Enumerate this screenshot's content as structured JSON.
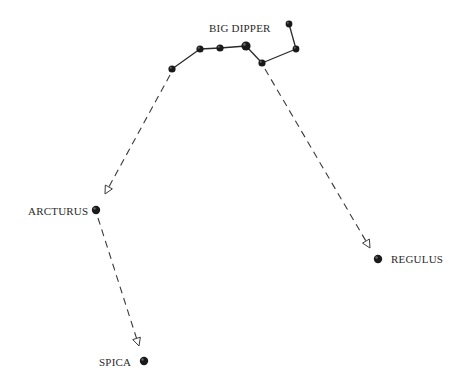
{
  "diagram": {
    "colors": {
      "background": "#ffffff",
      "ink": "#2a2a2a",
      "star_fill": "#1a1a1a"
    },
    "constellation": {
      "label": "BIG DIPPER",
      "label_pos": [
        209,
        32
      ],
      "stars": [
        {
          "id": "handle-end",
          "x": 172,
          "y": 69,
          "r": 3.6
        },
        {
          "id": "handle-2",
          "x": 200,
          "y": 49,
          "r": 3.6
        },
        {
          "id": "handle-3",
          "x": 220,
          "y": 48,
          "r": 3.6
        },
        {
          "id": "bowl-1",
          "x": 246,
          "y": 46,
          "r": 4.6
        },
        {
          "id": "bowl-2",
          "x": 262,
          "y": 63,
          "r": 3.6
        },
        {
          "id": "bowl-3",
          "x": 296,
          "y": 49,
          "r": 3.4
        },
        {
          "id": "bowl-4",
          "x": 289,
          "y": 24,
          "r": 3.4
        }
      ],
      "edges": [
        [
          0,
          1
        ],
        [
          1,
          2
        ],
        [
          2,
          3
        ],
        [
          3,
          4
        ],
        [
          4,
          5
        ],
        [
          5,
          6
        ]
      ]
    },
    "targets": [
      {
        "name": "ARCTURUS",
        "x": 96,
        "y": 210,
        "r": 4.2,
        "label_pos": [
          28,
          215
        ],
        "label_anchor": "start"
      },
      {
        "name": "SPICA",
        "x": 144,
        "y": 361,
        "r": 4.2,
        "label_pos": [
          99,
          366
        ],
        "label_anchor": "start"
      },
      {
        "name": "REGULUS",
        "x": 378,
        "y": 259,
        "r": 4.2,
        "label_pos": [
          391,
          263
        ],
        "label_anchor": "start"
      }
    ],
    "pointers": [
      {
        "name": "arc-to-arcturus",
        "from": [
          170,
          75
        ],
        "to": [
          105,
          194
        ]
      },
      {
        "name": "arcturus-to-spica",
        "from": [
          98,
          218
        ],
        "to": [
          139,
          346
        ]
      },
      {
        "name": "dipper-to-regulus",
        "from": [
          265,
          69
        ],
        "to": [
          370,
          248
        ]
      }
    ]
  }
}
